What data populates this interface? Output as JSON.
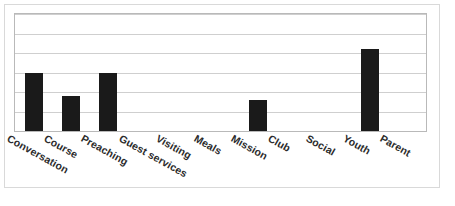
{
  "chart_data": {
    "type": "bar",
    "title": "",
    "subtitle": "",
    "xlabel": "",
    "ylabel": "",
    "categories": [
      "Conversation",
      "Course",
      "Preaching",
      "Guest services",
      "Visiting",
      "Meals",
      "Mission",
      "Club",
      "Social",
      "Youth",
      "Parent"
    ],
    "values": [
      3,
      1.8,
      3,
      0,
      0,
      0,
      1.6,
      0,
      0,
      4.2,
      0
    ],
    "ylim": [
      0,
      6
    ],
    "yticks": [
      0,
      1,
      2,
      3,
      4,
      5,
      6
    ],
    "ytick_labels": [
      "",
      "",
      "",
      "",
      "",
      "",
      ""
    ],
    "grid": true,
    "grid_axis": "y",
    "legend": false,
    "legend_position": "none",
    "bar_color": "#1a1a1a",
    "gridline_color": "#cfcfcf",
    "axis_color": "#b9b9b9",
    "plot_background": "#ffffff",
    "label_rotation_deg": -29
  },
  "figure": {
    "border_color": "#d9d9d9",
    "background": "#ffffff"
  }
}
